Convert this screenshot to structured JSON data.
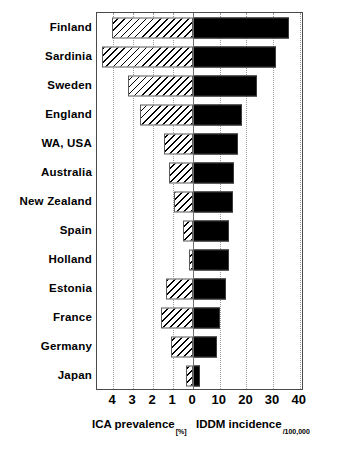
{
  "chart_data": {
    "type": "bar",
    "orientation": "horizontal",
    "layout": "bidirectional-pyramid",
    "title": "",
    "categories": [
      "Finland",
      "Sardinia",
      "Sweden",
      "England",
      "WA, USA",
      "Australia",
      "New Zealand",
      "Spain",
      "Holland",
      "Estonia",
      "France",
      "Germany",
      "Japan"
    ],
    "series": [
      {
        "name": "ICA prevalence",
        "unit": "[%]",
        "direction": "left",
        "axis_ticks": [
          4,
          3,
          2,
          1,
          0
        ],
        "axis_min": 0,
        "axis_max": 4.8,
        "values": [
          4.05,
          4.55,
          3.25,
          2.65,
          1.45,
          1.2,
          0.95,
          0.5,
          0.2,
          1.35,
          1.6,
          1.1,
          0.35
        ]
      },
      {
        "name": "IDDM incidence",
        "unit": "/100,000",
        "direction": "right",
        "axis_ticks": [
          0,
          10,
          20,
          30,
          40
        ],
        "axis_min": 0,
        "axis_max": 41,
        "values": [
          36,
          31,
          24,
          18.5,
          17,
          15.5,
          15,
          13.5,
          13.5,
          12.5,
          10,
          9,
          2.5
        ]
      }
    ],
    "xlabel_left": "ICA prevalence",
    "xlabel_left_unit": "[%]",
    "xlabel_right": "IDDM incidence",
    "xlabel_right_unit": "/100,000",
    "ylabel": "",
    "grid": true,
    "grid_style": "dotted-vertical",
    "legend": "none",
    "colors": {
      "ica_fill": "#ffffff",
      "ica_hatch": "#000000",
      "iddm_fill": "#000000",
      "frame": "#4a4a4a",
      "gridline": "#9a9a9a",
      "text": "#000000"
    }
  },
  "axis": {
    "left_ticks": [
      "4",
      "3",
      "2",
      "1"
    ],
    "zero_tick": "0",
    "right_ticks": [
      "10",
      "20",
      "30",
      "40"
    ]
  }
}
